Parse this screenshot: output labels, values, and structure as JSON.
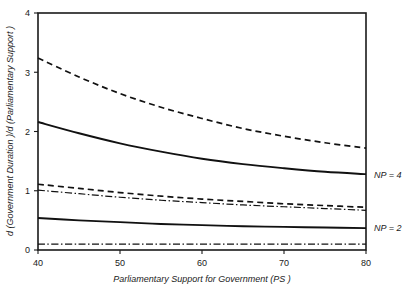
{
  "chart_data": {
    "type": "line",
    "title": "",
    "subtitle": "",
    "xlabel": "Parliamentary Support for Government  (PS )",
    "ylabel": "d (Government Duration )/d (Parliamentary Support )",
    "xlim": [
      40,
      80
    ],
    "ylim": [
      0,
      4
    ],
    "xticks": [
      40,
      50,
      60,
      70,
      80
    ],
    "xtick_labels": [
      "40",
      "50",
      "60",
      "70",
      "80"
    ],
    "yticks": [
      0,
      1,
      2,
      3,
      4
    ],
    "ytick_labels": [
      "0",
      "1",
      "2",
      "3",
      "4"
    ],
    "grid": false,
    "legend_position": "right-inline",
    "annotations": [
      {
        "text": "NP = 4",
        "x": 80,
        "y": 1.28
      },
      {
        "text": "NP = 2",
        "x": 80,
        "y": 0.37
      }
    ],
    "x": [
      40,
      45,
      50,
      55,
      60,
      65,
      70,
      75,
      80
    ],
    "series": [
      {
        "name": "upper-dashed",
        "style": "dashed",
        "values": [
          3.24,
          2.92,
          2.64,
          2.41,
          2.22,
          2.05,
          1.92,
          1.81,
          1.72
        ]
      },
      {
        "name": "np4-solid",
        "style": "solid",
        "values": [
          2.16,
          1.97,
          1.8,
          1.66,
          1.54,
          1.45,
          1.38,
          1.32,
          1.28
        ]
      },
      {
        "name": "mid-dashed",
        "style": "dashed",
        "values": [
          1.11,
          1.04,
          0.97,
          0.91,
          0.86,
          0.82,
          0.78,
          0.75,
          0.72
        ]
      },
      {
        "name": "mid-dashdot",
        "style": "dashdot",
        "values": [
          1.01,
          0.95,
          0.89,
          0.84,
          0.8,
          0.76,
          0.73,
          0.7,
          0.67
        ]
      },
      {
        "name": "np2-solid",
        "style": "solid",
        "values": [
          0.54,
          0.5,
          0.47,
          0.44,
          0.42,
          0.4,
          0.39,
          0.38,
          0.37
        ]
      },
      {
        "name": "baseline-dashdot",
        "style": "flatdashdot",
        "values": [
          0.1,
          0.1,
          0.1,
          0.1,
          0.1,
          0.1,
          0.1,
          0.1,
          0.1
        ]
      }
    ],
    "colors": {
      "axis": "#1a1a1a",
      "curve": "#111111",
      "background": "#ffffff"
    }
  }
}
